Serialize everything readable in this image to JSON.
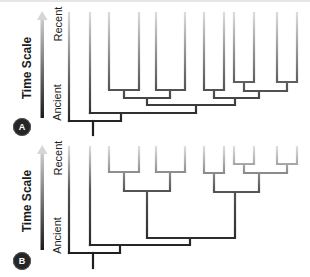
{
  "panels": [
    {
      "id": "A",
      "badge": "A",
      "axis_title": "Time Scale",
      "axis_top_label": "Recent",
      "axis_bottom_label": "Ancient",
      "description": "Cladogram with nodes spread over time; 12 lineages"
    },
    {
      "id": "B",
      "badge": "B",
      "axis_title": "Time Scale",
      "axis_top_label": "Recent",
      "axis_bottom_label": "Ancient",
      "description": "Cladogram with same topology; deep internal node branches early and recent clades diversify late"
    }
  ],
  "colors": {
    "line_dark": "#1e1e1e",
    "line_light": "#d4d4d4",
    "badge_bg": "#262626",
    "badge_fg": "#ffffff"
  }
}
